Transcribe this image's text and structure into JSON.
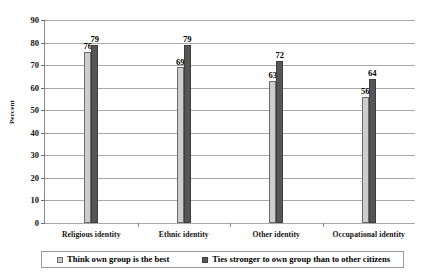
{
  "chart_data": {
    "type": "bar",
    "title": "",
    "xlabel": "",
    "ylabel": "Percent",
    "ylim": [
      0,
      90
    ],
    "ytick_step": 10,
    "yticks": [
      90,
      80,
      70,
      60,
      50,
      40,
      30,
      20,
      10,
      0
    ],
    "grid": true,
    "legend_position": "bottom",
    "categories": [
      "Religious identity",
      "Ethnic identity",
      "Other identity",
      "Occupational identity"
    ],
    "series": [
      {
        "name": "Think own group is the best",
        "color": "#cdcdcd",
        "values": [
          76,
          69,
          63,
          56
        ]
      },
      {
        "name": "Ties stronger to own group than to other citizens",
        "color": "#565656",
        "values": [
          79,
          79,
          72,
          64
        ]
      }
    ]
  }
}
